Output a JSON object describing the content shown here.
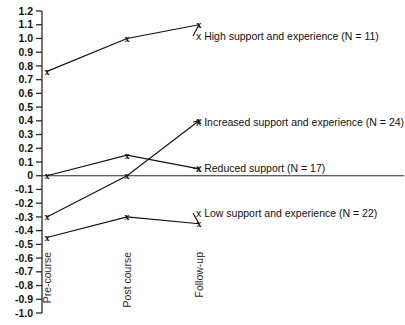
{
  "chart_data": {
    "type": "line",
    "title": "",
    "xlabel": "",
    "ylabel": "",
    "categories": [
      "Pre-course",
      "Post course",
      "Follow-up"
    ],
    "ylim": [
      -1.0,
      1.2
    ],
    "yticks": [
      "1.2",
      "1.1",
      "1.0",
      "0.9",
      "0.8",
      "0.7",
      "0.6",
      "0.5",
      "0.4",
      "0.3",
      "0.2",
      "0.1",
      "0",
      "-0.1",
      "-0.2",
      "-0.3",
      "-0.4",
      "-0.5",
      "-0.6",
      "-0.7",
      "-0.8",
      "-0.9",
      "-1.0"
    ],
    "ytick_values": [
      1.2,
      1.1,
      1.0,
      0.9,
      0.8,
      0.7,
      0.6,
      0.5,
      0.4,
      0.3,
      0.2,
      0.1,
      0,
      -0.1,
      -0.2,
      -0.3,
      -0.4,
      -0.5,
      -0.6,
      -0.7,
      -0.8,
      -0.9,
      -1.0
    ],
    "grid": false,
    "legend_position": "inline-right-of-line-ends",
    "marker": "x",
    "zero_line": true,
    "series": [
      {
        "name": "High support and experience",
        "n": 11,
        "label": "x High support and experience (N = 11)",
        "values": [
          0.76,
          1.0,
          1.1
        ]
      },
      {
        "name": "Increased support and experience",
        "n": 24,
        "label": "x Increased support and experience (N = 24)",
        "values": [
          -0.3,
          0.0,
          0.4
        ]
      },
      {
        "name": "Reduced support",
        "n": 17,
        "label": "x Reduced support (N = 17)",
        "values": [
          0.0,
          0.15,
          0.05
        ]
      },
      {
        "name": "Low support and experience",
        "n": 22,
        "label": "x Low support and experience (N = 22)",
        "values": [
          -0.45,
          -0.3,
          -0.35
        ]
      }
    ]
  }
}
